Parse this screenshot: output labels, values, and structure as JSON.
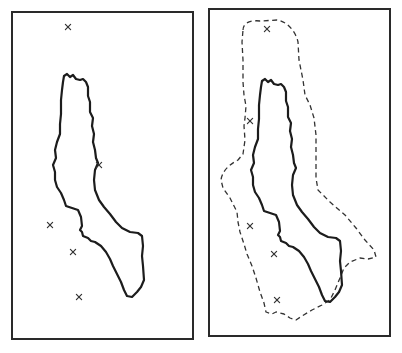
{
  "figure": {
    "type": "two-panel map diagram",
    "panels": [
      {
        "id": "left",
        "description": "Coastline of an elongated peninsula with scattered point observations (x markers)",
        "frame": {
          "x": 12,
          "y": 12,
          "width": 181,
          "height": 327
        },
        "coast_offset": [
          0,
          0
        ],
        "markers": [
          {
            "label": "×",
            "x": 68,
            "y": 27
          },
          {
            "label": "×",
            "x": 99,
            "y": 165
          },
          {
            "label": "×",
            "x": 50,
            "y": 225
          },
          {
            "label": "×",
            "x": 73,
            "y": 252
          },
          {
            "label": "×",
            "x": 79,
            "y": 297
          }
        ],
        "has_buffer": false
      },
      {
        "id": "right",
        "description": "Same coastline with point observations enclosed by a dashed buffer/envelope region",
        "frame": {
          "x": 209,
          "y": 9,
          "width": 181,
          "height": 327
        },
        "coast_offset": [
          198,
          5
        ],
        "markers": [
          {
            "label": "×",
            "x": 267,
            "y": 29
          },
          {
            "label": "×",
            "x": 250,
            "y": 121
          },
          {
            "label": "×",
            "x": 250,
            "y": 226
          },
          {
            "label": "×",
            "x": 274,
            "y": 254
          },
          {
            "label": "×",
            "x": 277,
            "y": 300
          }
        ],
        "has_buffer": true
      }
    ],
    "colors": {
      "frame": "#2a2a2a",
      "coast": "#1c1c1c",
      "buffer": "#333333",
      "marker": "#333333",
      "background": "#ffffff"
    }
  }
}
